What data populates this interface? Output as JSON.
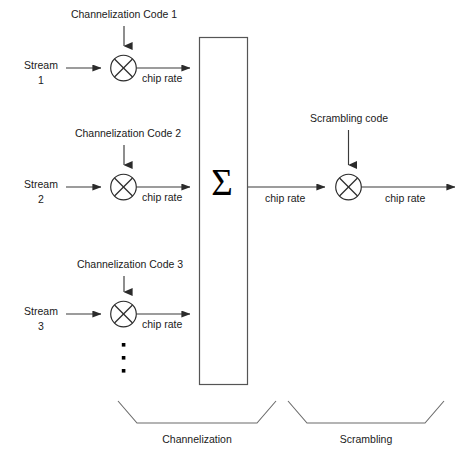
{
  "diagram": {
    "streams": [
      {
        "label_line1": "Stream",
        "label_line2": "1",
        "code_label": "Channelization Code 1",
        "rate_label": "chip rate"
      },
      {
        "label_line1": "Stream",
        "label_line2": "2",
        "code_label": "Channelization Code 2",
        "rate_label": "chip rate"
      },
      {
        "label_line1": "Stream",
        "label_line2": "3",
        "code_label": "Channelization Code 3",
        "rate_label": "chip rate"
      }
    ],
    "summer": {
      "symbol": "Σ"
    },
    "summer_output_rate_label": "chip rate",
    "scrambler": {
      "code_label": "Scrambling code",
      "output_rate_label": "chip rate"
    },
    "vertical_ellipsis": "•",
    "brackets": [
      {
        "label": "Channelization"
      },
      {
        "label": "Scrambling"
      }
    ],
    "colors": {
      "background": "#ffffff",
      "wire": "#3a3a3a",
      "box_stroke": "#555555",
      "circle_stroke": "#2b2b2b",
      "bracket_stroke": "#6b6b6b",
      "text": "#1a1a1a"
    }
  }
}
